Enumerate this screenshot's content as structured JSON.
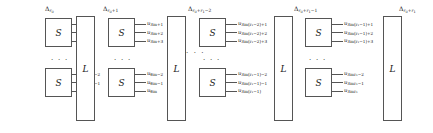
{
  "figure": {
    "type": "block-diagram",
    "background": "#ffffff",
    "line_color": "#555555",
    "box_labels": {
      "encoder": "S",
      "interleaver": "L"
    },
    "ellipsis": "· · ·"
  },
  "groups": [
    {
      "id": "group-1",
      "delta_label": {
        "base": "Δ",
        "sub": "r",
        "subsub": "0"
      },
      "top_block": {
        "box_label": "S",
        "outputs": [
          {
            "base": "u",
            "sub": "1"
          },
          {
            "base": "u",
            "sub": "2"
          },
          {
            "base": "u",
            "sub": "3"
          }
        ]
      },
      "bottom_block": {
        "box_label": "S",
        "outputs": [
          {
            "base": "u",
            "sub": "3m−2"
          },
          {
            "base": "u",
            "sub": "3m−1"
          },
          {
            "base": "u",
            "sub": "3m"
          }
        ]
      },
      "interleaver": {
        "label": "L"
      }
    },
    {
      "id": "group-2",
      "delta_label": {
        "base": "Δ",
        "sub": "r",
        "subsub": "0",
        "suffix": "+1"
      },
      "top_block": {
        "box_label": "S",
        "outputs": [
          {
            "base": "u",
            "sub": "3m+1"
          },
          {
            "base": "u",
            "sub": "3m+2"
          },
          {
            "base": "u",
            "sub": "3m+3"
          }
        ]
      },
      "bottom_block": {
        "box_label": "S",
        "outputs": [
          {
            "base": "u",
            "sub": "6m−2"
          },
          {
            "base": "u",
            "sub": "6m−1"
          },
          {
            "base": "u",
            "sub": "6m"
          }
        ]
      },
      "interleaver": {
        "label": "L"
      }
    },
    {
      "id": "group-3",
      "delta_label": {
        "base": "Δ",
        "sub": "r",
        "subsub": "0",
        "suffix": "+r",
        "suffix_sub": "1",
        "suffix2": "−2"
      },
      "top_block": {
        "box_label": "S",
        "outputs": [
          {
            "base": "u",
            "sub": "3m(r₁−2)+1"
          },
          {
            "base": "u",
            "sub": "3m(r₁−2)+2"
          },
          {
            "base": "u",
            "sub": "3m(r₁−2)+3"
          }
        ]
      },
      "bottom_block": {
        "box_label": "S",
        "outputs": [
          {
            "base": "u",
            "sub": "3m(r₁−1)−2"
          },
          {
            "base": "u",
            "sub": "3m(r₁−1)−1"
          },
          {
            "base": "u",
            "sub": "3m(r₁−1)"
          }
        ]
      },
      "interleaver": {
        "label": "L"
      }
    },
    {
      "id": "group-4",
      "delta_label": {
        "base": "Δ",
        "sub": "r",
        "subsub": "0",
        "suffix": "+r",
        "suffix_sub": "1",
        "suffix2": "−1"
      },
      "top_block": {
        "box_label": "S",
        "outputs": [
          {
            "base": "u",
            "sub": "3m(r₁−1)+1"
          },
          {
            "base": "u",
            "sub": "3m(r₁−1)+2"
          },
          {
            "base": "u",
            "sub": "3m(r₁−1)+3"
          }
        ]
      },
      "bottom_block": {
        "box_label": "S",
        "outputs": [
          {
            "base": "u",
            "sub": "3mr₁−2"
          },
          {
            "base": "u",
            "sub": "3mr₁−1"
          },
          {
            "base": "u",
            "sub": "3mr₁"
          }
        ]
      },
      "interleaver": {
        "label": "L"
      }
    }
  ],
  "final_delta_label": {
    "base": "Δ",
    "sub": "r",
    "subsub": "0",
    "suffix": "+r",
    "suffix_sub": "1"
  }
}
